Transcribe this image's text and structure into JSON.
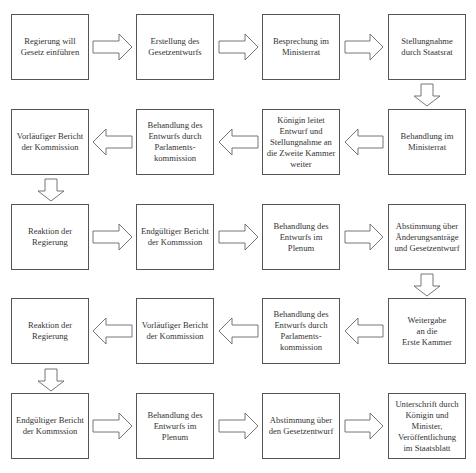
{
  "diagram": {
    "type": "flowchart",
    "language": "de",
    "boxes": [
      {
        "id": "b1",
        "label": "Regierung will\nGesetz einführen"
      },
      {
        "id": "b2",
        "label": "Erstellung des\nGesetzentwurfs"
      },
      {
        "id": "b3",
        "label": "Besprechung im\nMinisterrat"
      },
      {
        "id": "b4",
        "label": "Stellungnahme\ndurch Staatsrat"
      },
      {
        "id": "b5",
        "label": "Behandlung im\nMinisterrat"
      },
      {
        "id": "b6",
        "label": "Königin leitet\nEntwurf und\nStellungnahme an\ndie Zweite Kammer\nweiter"
      },
      {
        "id": "b7",
        "label": "Behandlung des\nEntwurfs durch\nParlaments-\nkommission"
      },
      {
        "id": "b8",
        "label": "Vorläufiger Bericht\nder Kommission"
      },
      {
        "id": "b9",
        "label": "Reaktion der\nRegierung"
      },
      {
        "id": "b10",
        "label": "Endgültiger Bericht\nder Kommssion"
      },
      {
        "id": "b11",
        "label": "Behandlung des\nEntwurfs im\nPlenum"
      },
      {
        "id": "b12",
        "label": "Abstimmung über\nÄnderungsanträge\nund Gesetzentwurf"
      },
      {
        "id": "b13",
        "label": "Weitergabe\nan die\nErste Kammer"
      },
      {
        "id": "b14",
        "label": "Behandlung des\nEntwurfs durch\nParlaments-\nkommission"
      },
      {
        "id": "b15",
        "label": "Vorläufiger Bericht\nder Kommission"
      },
      {
        "id": "b16",
        "label": "Reaktion der\nRegierung"
      },
      {
        "id": "b17",
        "label": "Endgültiger Bericht\nder Kommssion"
      },
      {
        "id": "b18",
        "label": "Behandlung des\nEntwurfs im\nPlenum"
      },
      {
        "id": "b19",
        "label": "Abstimmung über\nden Gesetzentwurf"
      },
      {
        "id": "b20",
        "label": "Unterschrift durch\nKönigin und\nMinister,\nVeröffentlichung\nim Staatsblatt"
      }
    ],
    "edges": [
      [
        "b1",
        "b2"
      ],
      [
        "b2",
        "b3"
      ],
      [
        "b3",
        "b4"
      ],
      [
        "b4",
        "b5"
      ],
      [
        "b5",
        "b6"
      ],
      [
        "b6",
        "b7"
      ],
      [
        "b7",
        "b8"
      ],
      [
        "b8",
        "b9"
      ],
      [
        "b9",
        "b10"
      ],
      [
        "b10",
        "b11"
      ],
      [
        "b11",
        "b12"
      ],
      [
        "b12",
        "b13"
      ],
      [
        "b13",
        "b14"
      ],
      [
        "b14",
        "b15"
      ],
      [
        "b15",
        "b16"
      ],
      [
        "b16",
        "b17"
      ],
      [
        "b17",
        "b18"
      ],
      [
        "b18",
        "b19"
      ],
      [
        "b19",
        "b20"
      ]
    ]
  }
}
